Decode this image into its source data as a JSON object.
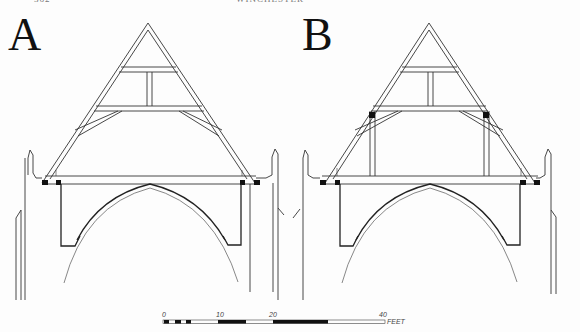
{
  "page": {
    "page_number": "362",
    "running_head": "WINCHESTER"
  },
  "figure": {
    "panels": [
      {
        "id": "A",
        "label": "A",
        "description": "Roof truss section with two collar beams, king post and curved braces, no vertical posts"
      },
      {
        "id": "B",
        "label": "B",
        "description": "Roof truss section with two collar beams, king post, braces and vertical posts carrying the lower collar"
      }
    ],
    "scale_bar": {
      "ticks": [
        "0",
        "10",
        "20",
        "40"
      ],
      "unit": "FEET"
    },
    "colors": {
      "line": "#333333",
      "fill_black": "#111111",
      "background": "#fdfdfd"
    }
  }
}
